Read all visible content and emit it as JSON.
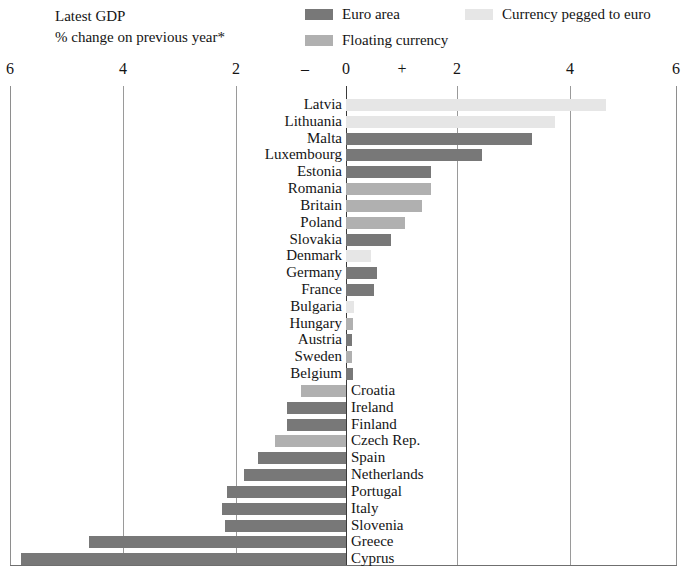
{
  "title": {
    "line1": "Latest GDP",
    "line2": "% change on previous year*"
  },
  "legend": {
    "items": [
      {
        "label": "Euro area",
        "color": "#787878",
        "swatch_name": "euro-area-swatch"
      },
      {
        "label": "Currency pegged to euro",
        "color": "#e6e6e6",
        "swatch_name": "pegged-currency-swatch"
      },
      {
        "label": "Floating currency",
        "color": "#b0b0b0",
        "swatch_name": "floating-currency-swatch"
      }
    ]
  },
  "axis": {
    "tick_labels": [
      "6",
      "4",
      "2",
      "–",
      "0",
      "+",
      "2",
      "4",
      "6"
    ],
    "tick_x": [
      10,
      123,
      236,
      305,
      346,
      402,
      457,
      570,
      676
    ],
    "gridline_x": [
      10,
      123,
      236,
      346,
      457,
      570,
      676
    ],
    "zero_x": 346,
    "px_per_unit": 56.5
  },
  "chart_data": {
    "type": "bar",
    "orientation": "horizontal",
    "title": "Latest GDP",
    "subtitle": "% change on previous year*",
    "xlabel": "",
    "ylabel": "",
    "xlim": [
      -6,
      6
    ],
    "grid": true,
    "legend_position": "top",
    "footnote": "*",
    "categories": [
      "Latvia",
      "Lithuania",
      "Malta",
      "Luxembourg",
      "Estonia",
      "Romania",
      "Britain",
      "Poland",
      "Slovakia",
      "Denmark",
      "Germany",
      "France",
      "Bulgaria",
      "Hungary",
      "Austria",
      "Sweden",
      "Belgium",
      "Croatia",
      "Ireland",
      "Finland",
      "Czech Rep.",
      "Spain",
      "Netherlands",
      "Portugal",
      "Italy",
      "Slovenia",
      "Greece",
      "Cyprus"
    ],
    "values": [
      4.6,
      3.7,
      3.3,
      2.4,
      1.5,
      1.5,
      1.35,
      1.05,
      0.8,
      0.45,
      0.55,
      0.5,
      0.15,
      0.12,
      0.1,
      0.1,
      0.12,
      -0.8,
      -1.05,
      -1.05,
      -1.25,
      -1.55,
      -1.8,
      -2.1,
      -2.2,
      -2.15,
      -4.55,
      -5.75
    ],
    "groups": [
      "pegged",
      "pegged",
      "euro",
      "euro",
      "euro",
      "floating",
      "floating",
      "floating",
      "euro",
      "pegged",
      "euro",
      "euro",
      "pegged",
      "floating",
      "euro",
      "floating",
      "euro",
      "floating",
      "euro",
      "euro",
      "floating",
      "euro",
      "euro",
      "euro",
      "euro",
      "euro",
      "euro",
      "euro"
    ],
    "group_colors": {
      "euro": "#787878",
      "pegged": "#e6e6e6",
      "floating": "#b0b0b0"
    }
  }
}
